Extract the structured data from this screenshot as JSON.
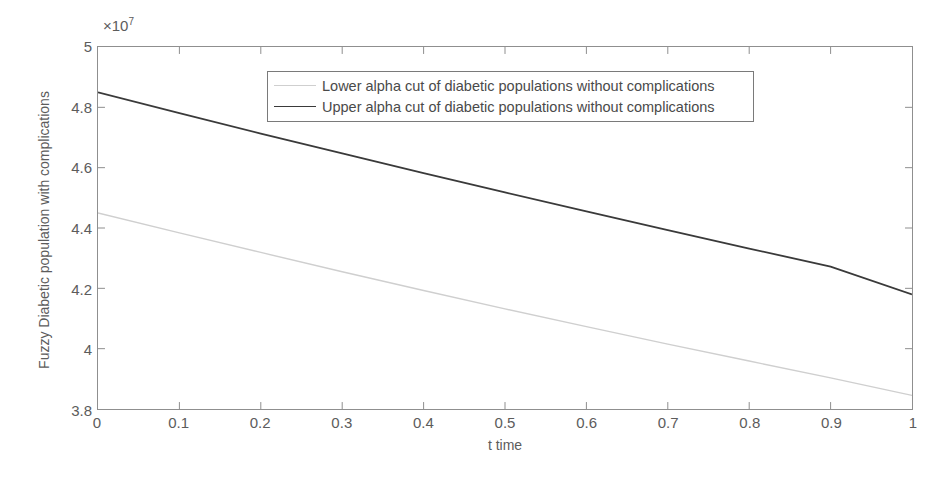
{
  "chart_data": {
    "type": "line",
    "title": "",
    "xlabel": "t time",
    "ylabel": "Fuzzy Diabetic population with complications",
    "y_exponent_label": "×10",
    "y_exponent_power": "7",
    "xlim": [
      0,
      1
    ],
    "ylim": [
      38000000,
      50000000
    ],
    "grid": false,
    "legend_position": "top-center",
    "x_ticks": [
      0,
      0.1,
      0.2,
      0.3,
      0.4,
      0.5,
      0.6,
      0.7,
      0.8,
      0.9,
      1
    ],
    "x_tick_labels": [
      "0",
      "0.1",
      "0.2",
      "0.3",
      "0.4",
      "0.5",
      "0.6",
      "0.7",
      "0.8",
      "0.9",
      "1"
    ],
    "y_ticks": [
      38000000,
      40000000,
      42000000,
      44000000,
      46000000,
      48000000,
      50000000
    ],
    "y_tick_labels": [
      "3.8",
      "4",
      "4.2",
      "4.4",
      "4.6",
      "4.8",
      "5"
    ],
    "x": [
      0,
      0.1,
      0.2,
      0.3,
      0.4,
      0.5,
      0.6,
      0.7,
      0.8,
      0.9,
      1
    ],
    "series": [
      {
        "name": "Lower alpha cut of diabetic populations without complications",
        "color": "#cfcfcf",
        "width": 1.4,
        "values": [
          44500000,
          44300000,
          44090000,
          43870000,
          43640000,
          43400000,
          43150000,
          42880000,
          42600000,
          42300000,
          38400000
        ]
      },
      {
        "name": "Upper alpha cut of diabetic populations without complications",
        "color": "#3a3a3a",
        "width": 1.8,
        "values": [
          48500000,
          48200000,
          47890000,
          47570000,
          47240000,
          46900000,
          46550000,
          46180000,
          45800000,
          45400000,
          41800000
        ]
      }
    ]
  },
  "chart_series_points": {
    "lower": [
      [
        0,
        44500000
      ],
      [
        0.1,
        43840000
      ],
      [
        0.2,
        43190000
      ],
      [
        0.3,
        42550000
      ],
      [
        0.4,
        41930000
      ],
      [
        0.5,
        41320000
      ],
      [
        0.6,
        40730000
      ],
      [
        0.7,
        40150000
      ],
      [
        0.8,
        39590000
      ],
      [
        0.9,
        39030000
      ],
      [
        1,
        38450000
      ]
    ],
    "upper": [
      [
        0,
        48500000
      ],
      [
        0.1,
        47810000
      ],
      [
        0.2,
        47130000
      ],
      [
        0.3,
        46470000
      ],
      [
        0.4,
        45820000
      ],
      [
        0.5,
        45180000
      ],
      [
        0.6,
        44550000
      ],
      [
        0.7,
        43930000
      ],
      [
        0.8,
        43320000
      ],
      [
        0.9,
        42720000
      ],
      [
        1,
        41800000
      ]
    ]
  },
  "legend": {
    "items": [
      {
        "label": "Lower alpha cut of diabetic populations without complications"
      },
      {
        "label": "Upper alpha cut of diabetic populations without complications"
      }
    ]
  }
}
